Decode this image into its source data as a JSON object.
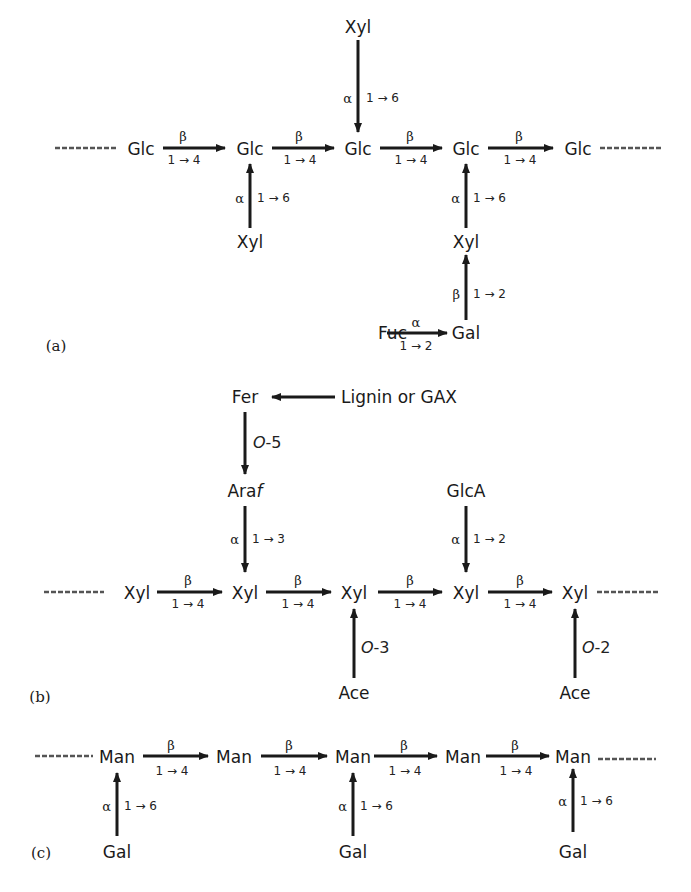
{
  "figure": {
    "panels": [
      {
        "id": "a",
        "label": "(a)",
        "name": "xyloglucan",
        "nodes": {
          "backbone": [
            "Glc",
            "Glc",
            "Glc",
            "Glc",
            "Glc"
          ],
          "xyl_top": "Xyl",
          "xyl_bottom_left": "Xyl",
          "xyl_bottom_right": "Xyl",
          "gal": "Gal",
          "fuc": "Fuc"
        },
        "links": {
          "backbone_anomer": "β",
          "backbone_bond": "1 → 4",
          "xyl_anomer": "α",
          "xyl_bond": "1 → 6",
          "gal_anomer": "β",
          "gal_bond": "1 → 2",
          "fuc_anomer": "α",
          "fuc_bond": "1 → 2"
        }
      },
      {
        "id": "b",
        "label": "(b)",
        "name": "arabinoxylan",
        "nodes": {
          "backbone": [
            "Xyl",
            "Xyl",
            "Xyl",
            "Xyl",
            "Xyl"
          ],
          "fer": "Fer",
          "lignin": "Lignin or GAX",
          "araf_prefix": "Ara",
          "araf_suffix": "f",
          "glca": "GlcA",
          "ace_left": "Ace",
          "ace_right": "Ace"
        },
        "links": {
          "backbone_anomer": "β",
          "backbone_bond": "1 → 4",
          "fer_o": "O",
          "fer_pos": "-5",
          "araf_anomer": "α",
          "araf_bond": "1 → 3",
          "glca_anomer": "α",
          "glca_bond": "1 → 2",
          "ace_left_o": "O",
          "ace_left_pos": "-3",
          "ace_right_o": "O",
          "ace_right_pos": "-2"
        }
      },
      {
        "id": "c",
        "label": "(c)",
        "name": "galactomannan",
        "nodes": {
          "backbone": [
            "Man",
            "Man",
            "Man",
            "Man",
            "Man"
          ],
          "gal": [
            "Gal",
            "Gal",
            "Gal"
          ]
        },
        "links": {
          "backbone_anomer": "β",
          "backbone_bond": "1 → 4",
          "gal_anomer": "α",
          "gal_bond": "1 → 6"
        }
      }
    ],
    "colors": {
      "ink": "#1a1a1a",
      "dash": "#555555"
    }
  }
}
